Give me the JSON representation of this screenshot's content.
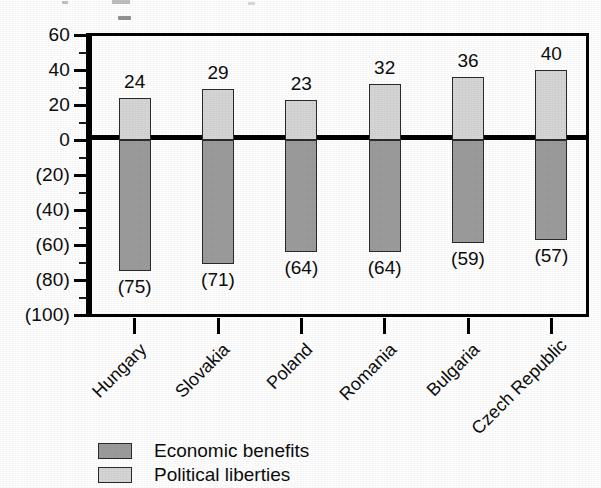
{
  "chart_data": {
    "type": "bar",
    "title": "",
    "subtitle": "",
    "xlabel": "",
    "ylabel": "",
    "ylim": [
      -100,
      60
    ],
    "y_major_step": 20,
    "y_minor_step": 10,
    "grid": false,
    "legend_position": "bottom-left",
    "orientation": "vertical",
    "zero_line": true,
    "negative_label_format": "parentheses",
    "categories": [
      "Hungary",
      "Slovakia",
      "Poland",
      "Romania",
      "Bulgaria",
      "Czech Republic"
    ],
    "series": [
      {
        "name": "Political liberties",
        "color": "#d6d6d6",
        "values": [
          24,
          29,
          23,
          32,
          36,
          40
        ],
        "value_labels": [
          "24",
          "29",
          "23",
          "32",
          "36",
          "40"
        ]
      },
      {
        "name": "Economic benefits",
        "color": "#9c9c9c",
        "values": [
          -75,
          -71,
          -64,
          -64,
          -59,
          -57
        ],
        "value_labels": [
          "(75)",
          "(71)",
          "(64)",
          "(64)",
          "(59)",
          "(57)"
        ]
      }
    ],
    "y_tick_labels": [
      "60",
      "40",
      "20",
      "0",
      "(20)",
      "(40)",
      "(60)",
      "(80)",
      "(100)"
    ],
    "y_tick_values": [
      60,
      40,
      20,
      0,
      -20,
      -40,
      -60,
      -80,
      -100
    ]
  },
  "legend": {
    "items": [
      {
        "label": "Economic benefits",
        "swatch": "dark"
      },
      {
        "label": "Political liberties",
        "swatch": "light"
      }
    ]
  },
  "colors": {
    "economic_benefits": "#9c9c9c",
    "political_liberties": "#d6d6d6",
    "axis": "#000000",
    "text": "#0d0d0d",
    "background": "#ffffff"
  }
}
